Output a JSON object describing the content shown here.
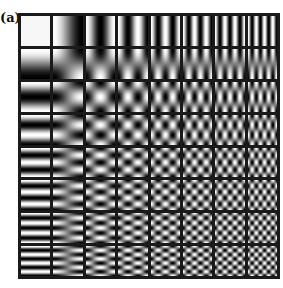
{
  "figure": {
    "label": "(a)",
    "grid_size": 8,
    "cell_pixels": 8,
    "separator_color": "#1a1a1a",
    "ordering": "row index = vertical frequency, column index = horizontal frequency"
  }
}
